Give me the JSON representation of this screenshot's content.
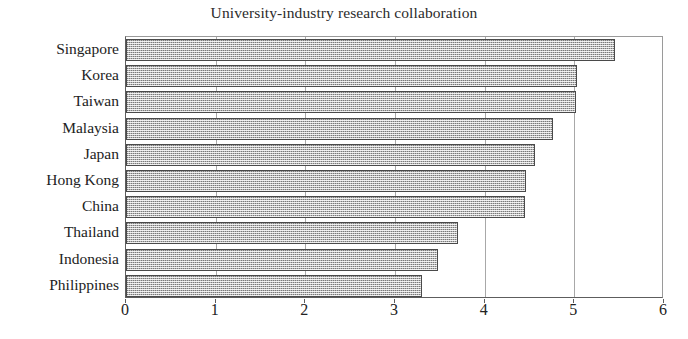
{
  "chart_data": {
    "type": "bar",
    "orientation": "horizontal",
    "title": "University-industry research collaboration",
    "xlabel": "",
    "ylabel": "",
    "xlim": [
      0,
      6
    ],
    "ylim": null,
    "grid": true,
    "legend": null,
    "xticks": [
      "0",
      "1",
      "2",
      "3",
      "4",
      "5",
      "6"
    ],
    "xtick_values": [
      0,
      1,
      2,
      3,
      4,
      5,
      6
    ],
    "categories": [
      "Singapore",
      "Korea",
      "Taiwan",
      "Malaysia",
      "Japan",
      "Hong Kong",
      "China",
      "Thailand",
      "Indonesia",
      "Philippines"
    ],
    "values": [
      5.45,
      5.03,
      5.02,
      4.76,
      4.56,
      4.46,
      4.45,
      3.7,
      3.48,
      3.3
    ],
    "bar_fill_color": "#b9b9b9",
    "bar_border_color": "#4a4a4a",
    "axis_color": "#5d5d5d",
    "gridline_color": "#a8a8a8",
    "background_color": "#ffffff",
    "text_color": "#222222"
  }
}
